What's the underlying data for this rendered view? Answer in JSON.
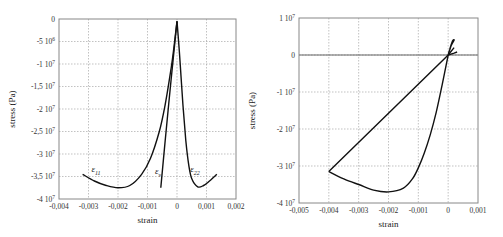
{
  "chart_data": [
    {
      "type": "line",
      "title": "",
      "xlabel": "strain",
      "ylabel": "stress (Pa)",
      "xlim": [
        -0.004,
        0.002
      ],
      "ylim": [
        -40000000,
        0
      ],
      "grid": true,
      "x_ticks": [
        -0.004,
        -0.003,
        -0.002,
        -0.001,
        0,
        0.001,
        0.002
      ],
      "x_tick_labels": [
        "-0,004",
        "-0,003",
        "-0,002",
        "-0,001",
        "0",
        "0,001",
        "0,002"
      ],
      "y_ticks": [
        0,
        -5000000,
        -10000000,
        -15000000,
        -20000000,
        -25000000,
        -30000000,
        -35000000,
        -40000000
      ],
      "y_tick_labels": [
        "0",
        "-5 10^6",
        "-1 10^7",
        "-1,5 10^7",
        "-2 10^7",
        "-2,5 10^7",
        "-3 10^7",
        "-3,5 10^7",
        "-4 10^7"
      ],
      "annotations": [
        {
          "text": "ε11",
          "x": -0.0029,
          "y": -34000000
        },
        {
          "text": "εv",
          "x": -0.00075,
          "y": -34500000
        },
        {
          "text": "ε22",
          "x": 0.00045,
          "y": -34000000
        }
      ],
      "series": [
        {
          "name": "ε11",
          "x": [
            -0.0032,
            -0.0028,
            -0.0024,
            -0.002,
            -0.0016,
            -0.0012,
            -0.0009,
            -0.0006,
            -0.0004,
            -0.0002,
            -0.0001,
            0
          ],
          "y": [
            -34500000,
            -36000000,
            -37000000,
            -37500000,
            -37000000,
            -34500000,
            -31000000,
            -25000000,
            -19000000,
            -11000000,
            -6000000,
            -500000
          ]
        },
        {
          "name": "εv",
          "x": [
            -0.00055,
            -0.0004,
            -0.0002,
            0
          ],
          "y": [
            -37500000,
            -27000000,
            -13500000,
            -500000
          ]
        },
        {
          "name": "ε22",
          "x": [
            0,
            0.0001,
            0.0002,
            0.0003,
            0.0004,
            0.0005,
            0.0007,
            0.0009,
            0.0011,
            0.00135
          ],
          "y": [
            -500000,
            -9000000,
            -19000000,
            -27000000,
            -32500000,
            -35500000,
            -37300000,
            -37000000,
            -36000000,
            -34500000
          ]
        }
      ]
    },
    {
      "type": "line",
      "title": "",
      "xlabel": "strain",
      "ylabel": "stress (Pa)",
      "xlim": [
        -0.005,
        0.001
      ],
      "ylim": [
        -40000000,
        10000000
      ],
      "grid": true,
      "x_ticks": [
        -0.005,
        -0.004,
        -0.003,
        -0.002,
        -0.001,
        0,
        0.001
      ],
      "x_tick_labels": [
        "-0,005",
        "-0,004",
        "-0,003",
        "-0,002",
        "-0,001",
        "0",
        "0,001"
      ],
      "y_ticks": [
        10000000,
        0,
        -10000000,
        -20000000,
        -30000000,
        -40000000
      ],
      "y_tick_labels": [
        "1 10^7",
        "0",
        "-1 10^7",
        "-2 10^7",
        "-3 10^7",
        "-4 10^7"
      ],
      "series": [
        {
          "name": "loading",
          "x": [
            0,
            -0.0002,
            -0.0004,
            -0.0006,
            -0.0008,
            -0.001,
            -0.0012,
            -0.0015,
            -0.002,
            -0.0025,
            -0.003,
            -0.0035,
            -0.004
          ],
          "y": [
            0,
            -8000000,
            -15500000,
            -21500000,
            -26500000,
            -30500000,
            -33500000,
            -36000000,
            -37000000,
            -36500000,
            -35000000,
            -33500000,
            -31500000
          ]
        },
        {
          "name": "unloading",
          "x": [
            -0.004,
            0,
            0.0002
          ],
          "y": [
            -31500000,
            0,
            2000000
          ]
        },
        {
          "name": "tension-loop",
          "x": [
            0,
            0.0001,
            0.0002,
            0.00015,
            5e-05,
            0
          ],
          "y": [
            0,
            2500000,
            4000000,
            3800000,
            1500000,
            0
          ]
        },
        {
          "name": "tension-tail",
          "x": [
            0,
            0.0002,
            0.0003
          ],
          "y": [
            0,
            500000,
            800000
          ]
        }
      ]
    }
  ]
}
